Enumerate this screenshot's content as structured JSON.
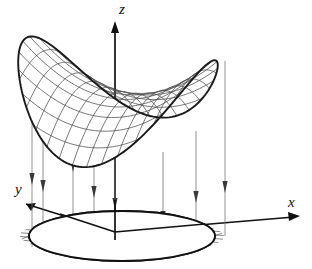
{
  "figure": {
    "kind": "3d-surface-diagram",
    "background_color": "#ffffff",
    "line_color": "#111111",
    "mesh_color": "#4a4a4a",
    "projection_color": "#6d6d6d",
    "width": 312,
    "height": 269
  },
  "axes": {
    "x": {
      "label": "x",
      "label_x": 288,
      "label_y": 207,
      "from": [
        115,
        232
      ],
      "to": [
        300,
        216
      ],
      "arrow": "right"
    },
    "y": {
      "label": "y",
      "label_x": 15,
      "label_y": 194,
      "from": [
        115,
        232
      ],
      "to": [
        22,
        203
      ],
      "arrow": "down-left"
    },
    "z": {
      "label": "z",
      "label_x": 119,
      "label_y": 14,
      "from": [
        115,
        232
      ],
      "to": [
        115,
        22
      ],
      "arrow": "up"
    }
  },
  "surface": {
    "name": "saddle-surface",
    "description": "wireframe hyperbolic paraboloid with two raised lobes and a central valley",
    "mesh_u_count": 13,
    "mesh_v_count": 11,
    "a": 92,
    "b": 40,
    "center_x": 118,
    "center_y": 96,
    "height_scale": 46
  },
  "domain_disk": {
    "name": "circular-domain",
    "center_x": 122,
    "center_y": 236,
    "radius_x": 93,
    "radius_y": 25,
    "mesh_count": 11
  },
  "projection_lines": {
    "count": 8,
    "arrow_direction": "down",
    "items": [
      {
        "x": 32,
        "top": 54,
        "bottom": 247,
        "arrow_y": 178
      },
      {
        "x": 43,
        "top": 48,
        "bottom": 250,
        "arrow_y": 185
      },
      {
        "x": 73,
        "top": 107,
        "bottom": 252,
        "arrow_y": 165
      },
      {
        "x": 94,
        "top": 117,
        "bottom": 252,
        "arrow_y": 191
      },
      {
        "x": 115,
        "top": 119,
        "bottom": 232,
        "arrow_y": 203
      },
      {
        "x": 163,
        "top": 152,
        "bottom": 243,
        "arrow_y": 216
      },
      {
        "x": 196,
        "top": 131,
        "bottom": 240,
        "arrow_y": 196
      },
      {
        "x": 225,
        "top": 61,
        "bottom": 236,
        "arrow_y": 186
      }
    ]
  }
}
